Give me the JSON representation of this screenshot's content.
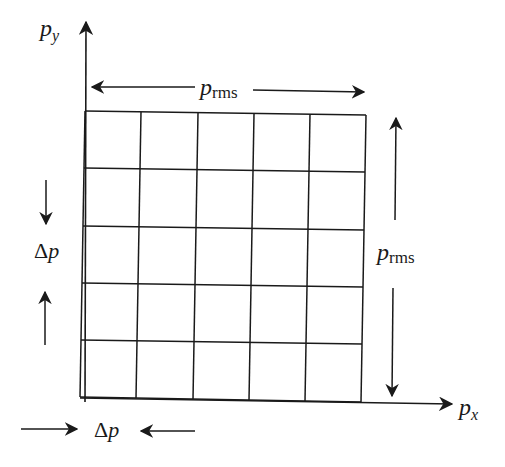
{
  "diagram": {
    "axes": {
      "y_label": "p",
      "y_sub": "y",
      "x_label": "p",
      "x_sub": "x"
    },
    "grid": {
      "rows": 5,
      "cols": 5
    },
    "top_span": {
      "label": "p",
      "sub": "rms"
    },
    "right_span": {
      "label": "p",
      "sub": "rms"
    },
    "left_cell": {
      "delta": "Δ",
      "label": "p"
    },
    "bottom_cell": {
      "delta": "Δ",
      "label": "p"
    },
    "colors": {
      "ink": "#1a1a1a",
      "background": "#ffffff"
    }
  }
}
